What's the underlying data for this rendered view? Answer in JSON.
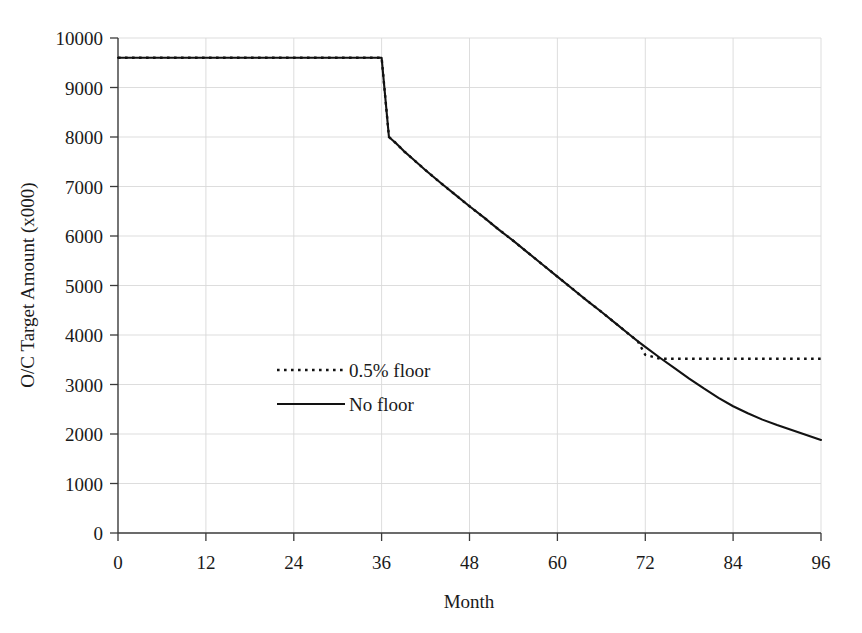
{
  "chart_data": {
    "type": "line",
    "title": "",
    "xlabel": "Month",
    "ylabel": "O/C Target Amount (x000)",
    "xlim": [
      0,
      96
    ],
    "ylim": [
      0,
      10000
    ],
    "grid": true,
    "legend_position": "center-left",
    "x_ticks": [
      "0",
      "12",
      "24",
      "36",
      "48",
      "60",
      "72",
      "84",
      "96"
    ],
    "y_ticks": [
      "0",
      "1000",
      "2000",
      "3000",
      "4000",
      "5000",
      "6000",
      "7000",
      "8000",
      "9000",
      "10000"
    ],
    "x": [
      0,
      3,
      6,
      9,
      12,
      15,
      18,
      21,
      24,
      27,
      30,
      33,
      36,
      37,
      38,
      39,
      40,
      42,
      44,
      46,
      48,
      50,
      52,
      54,
      56,
      58,
      60,
      62,
      64,
      66,
      68,
      70,
      71,
      72,
      74,
      76,
      78,
      80,
      82,
      84,
      86,
      88,
      90,
      92,
      94,
      96
    ],
    "series": [
      {
        "name": "No floor",
        "style": "solid",
        "values": [
          9600,
          9600,
          9600,
          9600,
          9600,
          9600,
          9600,
          9600,
          9600,
          9600,
          9600,
          9600,
          9600,
          8000,
          7870,
          7720,
          7590,
          7330,
          7080,
          6840,
          6600,
          6370,
          6130,
          5900,
          5660,
          5420,
          5180,
          4940,
          4700,
          4470,
          4230,
          3990,
          3870,
          3760,
          3540,
          3330,
          3120,
          2920,
          2730,
          2560,
          2420,
          2290,
          2180,
          2080,
          1980,
          1880
        ]
      },
      {
        "name": "0.5% floor",
        "style": "dotted",
        "values": [
          9600,
          9600,
          9600,
          9600,
          9600,
          9600,
          9600,
          9600,
          9600,
          9600,
          9600,
          9600,
          9600,
          8000,
          7870,
          7720,
          7590,
          7330,
          7080,
          6840,
          6600,
          6370,
          6130,
          5900,
          5660,
          5420,
          5180,
          4940,
          4700,
          4470,
          4230,
          3990,
          3870,
          3600,
          3520,
          3520,
          3520,
          3520,
          3520,
          3520,
          3520,
          3520,
          3520,
          3520,
          3520,
          3520
        ]
      }
    ],
    "legend": [
      {
        "label": "0.5% floor",
        "style": "dotted"
      },
      {
        "label": "No floor",
        "style": "solid"
      }
    ],
    "annotations": {
      "plateau_value": "9600",
      "drop_month": "36",
      "post_drop_value": "8000",
      "floor_value": "3520",
      "final_no_floor_value": "1880"
    },
    "colors": {
      "series_line": "#121212",
      "grid": "#d9d9d9",
      "axis": "#3a3a3a",
      "background": "#ffffff"
    }
  }
}
